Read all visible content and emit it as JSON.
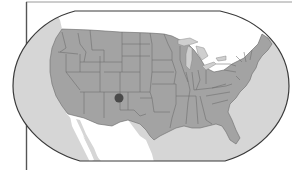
{
  "map": {
    "subject": "Contiguous United States",
    "projection_frame": "rounded-world-style",
    "marker": {
      "label": "location-marker",
      "approx_state": "New Mexico",
      "x": 119,
      "y": 98,
      "radius": 4.5,
      "color": "#4a4a4a"
    },
    "colors": {
      "background": "#ffffff",
      "ocean": "#d6d6d6",
      "usa_land": "#a3a3a3",
      "neighbor_land": "#ffffff",
      "state_lines": "#6b6b6b",
      "frame_outline": "#3a3a3a",
      "lakes": "#cfcfcf"
    }
  }
}
